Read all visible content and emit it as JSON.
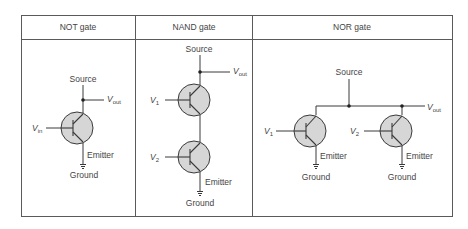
{
  "table": {
    "columns": [
      {
        "header": "NOT gate"
      },
      {
        "header": "NAND gate"
      },
      {
        "header": "NOR gate"
      }
    ]
  },
  "not_gate": {
    "source_label": "Source",
    "output_label": "V",
    "output_sub": "out",
    "input_label": "V",
    "input_sub": "in",
    "emitter_label": "Emitter",
    "ground_label": "Ground"
  },
  "nand_gate": {
    "source_label": "Source",
    "output_label": "V",
    "output_sub": "out",
    "input1_label": "V",
    "input1_sub": "1",
    "input2_label": "V",
    "input2_sub": "2",
    "emitter_label": "Emitter",
    "ground_label": "Ground"
  },
  "nor_gate": {
    "source_label": "Source",
    "output_label": "V",
    "output_sub": "out",
    "input1_label": "V",
    "input1_sub": "1",
    "input2_label": "V",
    "input2_sub": "2",
    "emitter1_label": "Emitter",
    "ground1_label": "Ground",
    "emitter2_label": "Emitter",
    "ground2_label": "Ground"
  },
  "colors": {
    "line": "#3a3a3a",
    "transistor_fill": "#d6d6d6",
    "border": "#555555",
    "text": "#444444"
  }
}
